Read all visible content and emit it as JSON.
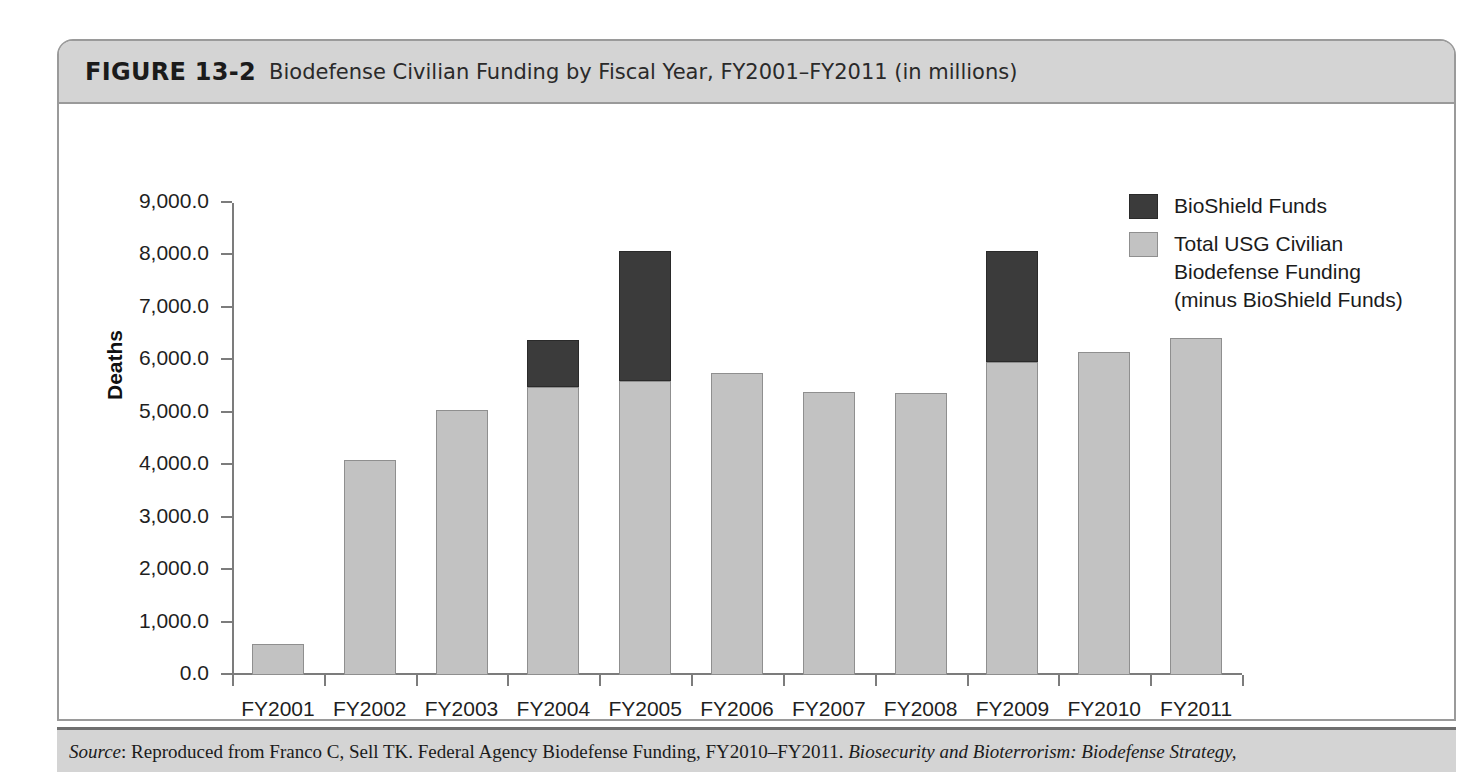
{
  "figure": {
    "label": "FIGURE 13-2",
    "caption": "Biodefense Civilian Funding by Fiscal Year, FY2001–FY2011 (in millions)"
  },
  "source": {
    "prefix": "Source",
    "colon": ": ",
    "body": "Reproduced from Franco C, Sell TK. Federal Agency Biodefense Funding, FY2010–FY2011. ",
    "journal": "Biosecurity and Bioterrorism: Biodefense Strategy,"
  },
  "legend": {
    "items": [
      {
        "label": "BioShield Funds",
        "lines": [
          "BioShield Funds"
        ],
        "color": "#3b3b3b"
      },
      {
        "label": "Total USG Civilian Biodefense Funding (minus BioShield Funds)",
        "lines": [
          "Total USG Civilian",
          "Biodefense Funding",
          "(minus BioShield Funds)"
        ],
        "color": "#c2c2c2"
      }
    ]
  },
  "chart_data": {
    "type": "bar",
    "stacked": true,
    "title": "Biodefense Civilian Funding by Fiscal Year, FY2001–FY2011 (in millions)",
    "xlabel": "",
    "ylabel": "Deaths",
    "ylim": [
      0,
      9000
    ],
    "ytick_step": 1000,
    "ytick_labels": [
      "0.0",
      "1,000.0",
      "2,000.0",
      "3,000.0",
      "4,000.0",
      "5,000.0",
      "6,000.0",
      "7,000.0",
      "8,000.0",
      "9,000.0"
    ],
    "grid": false,
    "legend_position": "top-right",
    "categories": [
      "FY2001",
      "FY2002",
      "FY2003",
      "FY2004",
      "FY2005",
      "FY2006",
      "FY2007",
      "FY2008",
      "FY2009",
      "FY2010",
      "FY2011"
    ],
    "series": [
      {
        "name": "Total USG Civilian Biodefense Funding (minus BioShield Funds)",
        "color": "#c2c2c2",
        "values": [
          600,
          4100,
          5050,
          5500,
          5600,
          5750,
          5400,
          5380,
          5960,
          6150,
          6420
        ]
      },
      {
        "name": "BioShield Funds",
        "color": "#3b3b3b",
        "values": [
          0,
          0,
          0,
          890,
          2480,
          0,
          0,
          0,
          2130,
          0,
          0
        ]
      }
    ],
    "totals": [
      600,
      4100,
      5050,
      6390,
      8080,
      5750,
      5400,
      5380,
      8090,
      6150,
      6420
    ]
  }
}
